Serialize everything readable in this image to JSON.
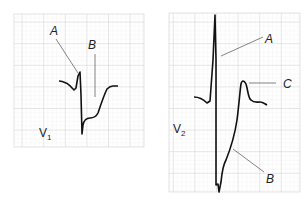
{
  "panels": [
    {
      "lead": "V",
      "lead_sub": "1",
      "labels": {
        "a": "A",
        "b": "B"
      }
    },
    {
      "lead": "V",
      "lead_sub": "2",
      "labels": {
        "a": "A",
        "b": "B",
        "c": "C"
      }
    }
  ],
  "colors": {
    "grid_minor": "#e4e4e4",
    "grid_major": "#c8c8c8",
    "trace": "#111111"
  }
}
